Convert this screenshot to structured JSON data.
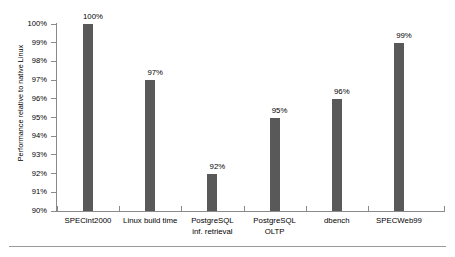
{
  "chart_data": {
    "type": "bar",
    "title": "",
    "subtitle": "",
    "xlabel": "",
    "ylabel": "Performance relative to native Linux",
    "categories": [
      "SPECint2000",
      "Linux build time",
      "PostgreSQL inf. retrieval",
      "PostgreSQL OLTP",
      "dbench",
      "SPECWeb99"
    ],
    "category_lines": [
      [
        "SPECint2000"
      ],
      [
        "Linux build time"
      ],
      [
        "PostgreSQL",
        "inf. retrieval"
      ],
      [
        "PostgreSQL",
        "OLTP"
      ],
      [
        "dbench"
      ],
      [
        "SPECWeb99"
      ]
    ],
    "values": [
      100,
      97,
      92,
      95,
      96,
      99
    ],
    "data_labels": [
      "100%",
      "97%",
      "92%",
      "95%",
      "96%",
      "99%"
    ],
    "ylim": [
      90,
      100
    ],
    "ytick_values": [
      100,
      99,
      98,
      97,
      96,
      95,
      94,
      93,
      92,
      91,
      90
    ],
    "ytick_labels": [
      "100%",
      "99%",
      "98%",
      "97%",
      "96%",
      "95%",
      "94%",
      "93%",
      "92%",
      "91%",
      "90%"
    ],
    "grid": false,
    "legend": null,
    "bar_color": "#595959",
    "axis_color": "#8a8a8a",
    "background_color": "#ffffff"
  }
}
